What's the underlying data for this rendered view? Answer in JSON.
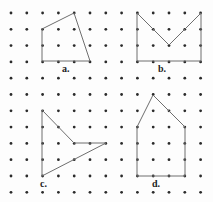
{
  "figure": {
    "width": 213,
    "height": 202,
    "background_color": "#fdfdfd",
    "dot_color": "#2b2b2b",
    "stroke_color": "#6e6e6e",
    "label_color": "#1d1d1d"
  },
  "grid": {
    "columns": 13,
    "rows": 12,
    "origin_x": 11,
    "origin_y": 13,
    "spacing_x": 15.8,
    "spacing_y": 16.3,
    "dot_radius": 1.4
  },
  "labels": [
    {
      "id": "label-a",
      "text": "a.",
      "x": 62,
      "y": 64
    },
    {
      "id": "label-b",
      "text": "b.",
      "x": 158,
      "y": 64
    },
    {
      "id": "label-c",
      "text": "c.",
      "x": 40,
      "y": 179
    },
    {
      "id": "label-d",
      "text": "d.",
      "x": 152,
      "y": 179
    }
  ],
  "shapes": [
    {
      "id": "shape-a",
      "label": "a.",
      "sides": 4,
      "closed": true,
      "points_grid": [
        [
          2,
          1
        ],
        [
          4,
          0
        ],
        [
          5,
          3
        ],
        [
          2,
          3
        ]
      ],
      "points_px": "42,29 74,13 90,61 42,61"
    },
    {
      "id": "shape-b",
      "label": "b.",
      "sides": 5,
      "closed": true,
      "points_grid": [
        [
          8,
          0
        ],
        [
          10,
          2
        ],
        [
          12,
          0
        ],
        [
          12,
          3
        ],
        [
          8,
          3
        ]
      ],
      "points_px": "137,13 169,45 201,13 201,61 137,61"
    },
    {
      "id": "shape-c",
      "label": "c.",
      "sides": 4,
      "closed": true,
      "points_grid": [
        [
          2,
          6
        ],
        [
          4,
          8
        ],
        [
          6,
          8
        ],
        [
          2,
          10
        ]
      ],
      "points_px": "42,110 74,143 106,143 42,176"
    },
    {
      "id": "shape-d",
      "label": "d.",
      "sides": 5,
      "closed": true,
      "points_grid": [
        [
          9,
          5
        ],
        [
          8,
          7
        ],
        [
          8,
          10
        ],
        [
          11,
          10
        ],
        [
          11,
          7
        ]
      ],
      "points_px": "153,95 137,127 137,176 185,176 185,127"
    }
  ]
}
